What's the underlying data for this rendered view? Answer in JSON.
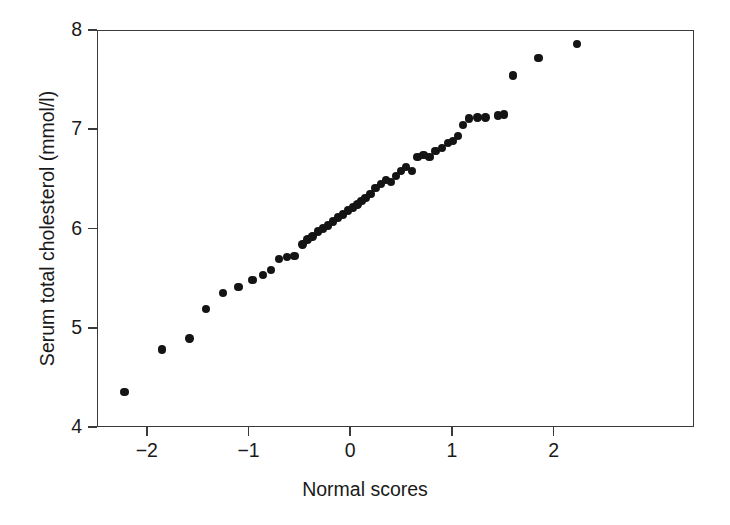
{
  "figure": {
    "type": "scatter",
    "background_color": "#ffffff",
    "point_color": "#141414",
    "axis_color": "#3a3a3a"
  },
  "axes": {
    "x_title": "Normal scores",
    "y_title": "Serum total cholesterol (mmol/l)",
    "x_ticks": [
      "−2",
      "−1",
      "0",
      "1",
      "2"
    ],
    "y_ticks": [
      "8",
      "7",
      "6",
      "5",
      "4"
    ]
  },
  "chart_data": {
    "type": "scatter",
    "title": "",
    "xlabel": "Normal scores",
    "ylabel": "Serum total cholesterol (mmol/l)",
    "xlim": [
      -2.49,
      3.38
    ],
    "ylim": [
      4.0,
      8.0
    ],
    "xticks": [
      -2,
      -1,
      0,
      1,
      2
    ],
    "yticks": [
      4,
      5,
      6,
      7,
      8
    ],
    "grid": false,
    "legend": null,
    "marker": "filled-circle",
    "n_points": 54,
    "series": [
      {
        "name": "Serum total cholesterol",
        "x": [
          -2.22,
          -1.85,
          -1.58,
          -1.42,
          -1.25,
          -1.1,
          -0.96,
          -0.86,
          -0.78,
          -0.7,
          -0.62,
          -0.55,
          -0.47,
          -0.42,
          -0.37,
          -0.32,
          -0.27,
          -0.22,
          -0.17,
          -0.12,
          -0.07,
          -0.02,
          0.03,
          0.07,
          0.11,
          0.15,
          0.2,
          0.25,
          0.3,
          0.35,
          0.4,
          0.45,
          0.5,
          0.55,
          0.61,
          0.66,
          0.72,
          0.78,
          0.84,
          0.9,
          0.96,
          1.01,
          1.06,
          1.11,
          1.17,
          1.25,
          1.33,
          1.45,
          1.51,
          1.6,
          1.85,
          2.23
        ],
        "y": [
          4.35,
          4.78,
          4.89,
          5.19,
          5.35,
          5.41,
          5.48,
          5.53,
          5.58,
          5.69,
          5.71,
          5.72,
          5.84,
          5.89,
          5.92,
          5.97,
          6.0,
          6.03,
          6.07,
          6.11,
          6.14,
          6.18,
          6.21,
          6.24,
          6.28,
          6.31,
          6.35,
          6.41,
          6.45,
          6.49,
          6.47,
          6.53,
          6.58,
          6.62,
          6.58,
          6.72,
          6.74,
          6.72,
          6.78,
          6.81,
          6.86,
          6.88,
          6.93,
          7.04,
          7.11,
          7.12,
          7.12,
          7.14,
          7.15,
          7.54,
          7.72,
          7.86
        ]
      }
    ]
  }
}
